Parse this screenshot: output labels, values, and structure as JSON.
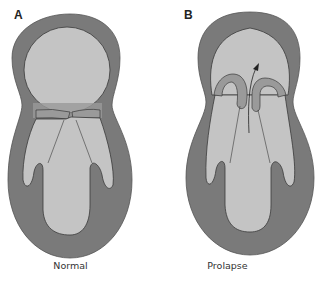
{
  "figure": {
    "panels": [
      {
        "letter": "A",
        "caption": "Normal"
      },
      {
        "letter": "B",
        "caption": "Prolapse"
      }
    ]
  },
  "colors": {
    "wall": "#7a7a7a",
    "chamber": "#c4c4c4",
    "outline": "#3a3a3a",
    "leaflet": "#9a9a9a",
    "background": "#ffffff"
  }
}
